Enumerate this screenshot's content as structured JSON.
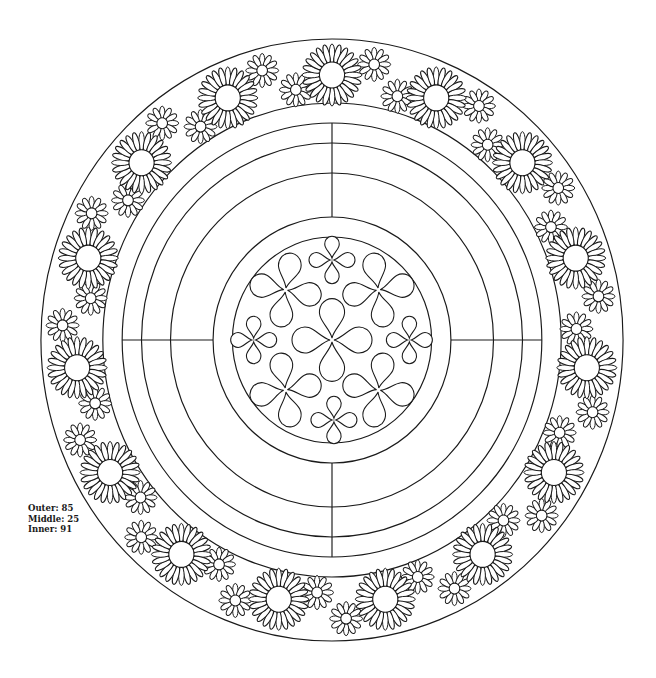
{
  "legend": {
    "items": [
      {
        "label": "Outer:",
        "value": "85"
      },
      {
        "label": "Middle:",
        "value": "25"
      },
      {
        "label": "Inner:",
        "value": "91"
      }
    ]
  },
  "colors": {
    "stroke": "#1a1a1a",
    "fill": "#ffffff",
    "background": "#ffffff"
  },
  "mandala": {
    "center": [
      332,
      340
    ],
    "x_scale": 0.967,
    "ring_radii": [
      301,
      237,
      217,
      197,
      167,
      123,
      103
    ],
    "crosshair": {
      "from_r": 123,
      "to_r": 217
    },
    "large_daisies": {
      "count": 15,
      "radius": 265,
      "start_angle_deg": 0,
      "petals": 24,
      "petal_len": 29,
      "disc_r": 13
    },
    "small_daisies": [
      {
        "offset_deg": 9,
        "radius": 279,
        "petals": 12,
        "petal_len": 15,
        "disc_r": 5.5
      },
      {
        "offset_deg": 15.5,
        "radius": 253,
        "petals": 12,
        "petal_len": 15,
        "disc_r": 5.5
      }
    ],
    "clovers": [
      {
        "dx": 0,
        "dy": 0,
        "size": 40,
        "rot": 0
      },
      {
        "dx": -48,
        "dy": -50,
        "size": 36,
        "rot": 10
      },
      {
        "dx": 48,
        "dy": -50,
        "size": 36,
        "rot": -10
      },
      {
        "dx": -48,
        "dy": 50,
        "size": 36,
        "rot": -10
      },
      {
        "dx": 48,
        "dy": 50,
        "size": 36,
        "rot": 10
      },
      {
        "dx": 0,
        "dy": -80,
        "size": 23,
        "rot": 0
      },
      {
        "dx": -81,
        "dy": 0,
        "size": 23,
        "rot": 0
      },
      {
        "dx": 80,
        "dy": 0,
        "size": 23,
        "rot": 0
      },
      {
        "dx": 2,
        "dy": 80,
        "size": 23,
        "rot": 0
      }
    ]
  }
}
